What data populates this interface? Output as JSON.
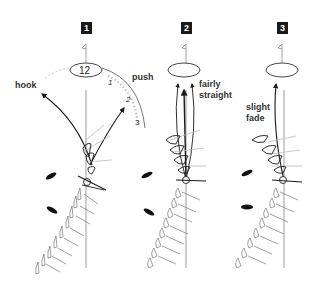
{
  "diagram": {
    "type": "golf-swing-path-illustration",
    "panels": [
      {
        "number": "1",
        "clock_center_label": "12",
        "clock_marks": [
          "1",
          "2",
          "3"
        ],
        "labels": {
          "left": "hook",
          "right": "push"
        }
      },
      {
        "number": "2",
        "labels": {
          "right_line1": "fairly",
          "right_line2": "straight"
        }
      },
      {
        "number": "3",
        "labels": {
          "left_line1": "slight",
          "left_line2": "fade"
        }
      }
    ],
    "colors": {
      "ink": "#1a1a1a",
      "light_ink": "#999999",
      "background": "#ffffff"
    }
  }
}
